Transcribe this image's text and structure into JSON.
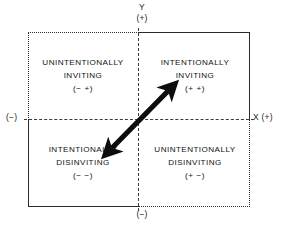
{
  "figure": {
    "type": "quadrant-diagram",
    "background_color": "#ffffff",
    "ink_color": "#1a1a1a"
  },
  "axes": {
    "y_name": "Y",
    "y_positive": "(+)",
    "y_negative": "(−)",
    "x_negative": "(−)",
    "x_positive": "X (+)"
  },
  "quadrants": [
    {
      "id": "upper-left",
      "line1": "UNINTENTIONALLY",
      "line2": "INVITING",
      "signs": "(− +)",
      "border_style": "dotted"
    },
    {
      "id": "upper-right",
      "line1": "INTENTIONALLY",
      "line2": "INVITING",
      "signs": "(+ +)",
      "border_style": "solid"
    },
    {
      "id": "lower-left",
      "line1": "INTENTIONALLY",
      "line2": "DISINVITING",
      "signs": "(− −)",
      "border_style": "solid"
    },
    {
      "id": "lower-right",
      "line1": "UNINTENTIONALLY",
      "line2": "DISINVITING",
      "signs": "(+ −)",
      "border_style": "dotted"
    }
  ],
  "annotation": {
    "arrow": "double-headed-diagonal-arrow",
    "arrow_color": "#0d0d0d",
    "direction": "lower-left to upper-right through origin"
  }
}
